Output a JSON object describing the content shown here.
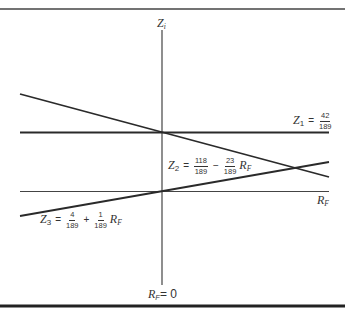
{
  "diagram": {
    "axes": {
      "vertical_label_main": "Z",
      "vertical_label_sub": "i",
      "horizontal_label_main": "R",
      "horizontal_label_sub": "F",
      "origin_label_main": "R",
      "origin_label_sub": "F",
      "origin_label_eq": "= 0"
    },
    "lines": [
      {
        "id": "Z1",
        "name_main": "Z",
        "name_sub": "1",
        "eq": "=",
        "const_num": "42",
        "const_den": "189"
      },
      {
        "id": "Z2",
        "name_main": "Z",
        "name_sub": "2",
        "eq": "=",
        "const_num": "118",
        "const_den": "189",
        "op": "−",
        "coef_num": "23",
        "coef_den": "189",
        "var_main": "R",
        "var_sub": "F"
      },
      {
        "id": "Z3",
        "name_main": "Z",
        "name_sub": "3",
        "eq": "=",
        "const_num": "4",
        "const_den": "189",
        "op": "+",
        "coef_num": "1",
        "coef_den": "189",
        "var_main": "R",
        "var_sub": "F"
      }
    ],
    "colors": {
      "line": "#2a2a2a",
      "frame": "#333333",
      "background": "#ffffff"
    }
  }
}
